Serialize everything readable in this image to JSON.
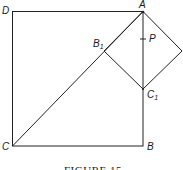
{
  "figure": {
    "caption": "FIGURE 15",
    "labels": {
      "A": "A",
      "B": "B",
      "C": "C",
      "D": "D",
      "B1_main": "B",
      "B1_sub": "1",
      "C1_main": "C",
      "C1_sub": "1",
      "P": "P"
    },
    "stroke_color": "#222222"
  }
}
